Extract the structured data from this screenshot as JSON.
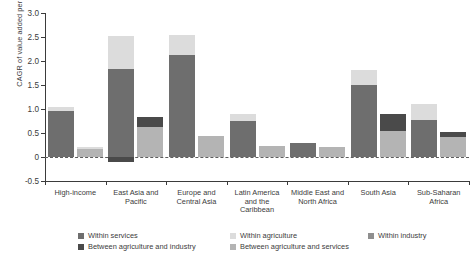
{
  "chart_data": {
    "type": "bar",
    "subtype": "grouped-stacked",
    "title": "",
    "xlabel": "",
    "ylabel": "CAGR of value added per worker (%)",
    "ylim": [
      -0.5,
      3.0
    ],
    "yticks": [
      "3.0",
      "2.5",
      "2.0",
      "1.5",
      "1.0",
      "0.5",
      "0",
      "-0.5"
    ],
    "ytick_values": [
      3.0,
      2.5,
      2.0,
      1.5,
      1.0,
      0.5,
      0.0,
      -0.5
    ],
    "grid": false,
    "zero_reference_line": true,
    "legend_position": "bottom",
    "categories": [
      "High-income",
      "East Asia and Pacific",
      "Europe and Central Asia",
      "Latin America and the Caribbean",
      "Middle East and North Africa",
      "South Asia",
      "Sub-Saharan Africa"
    ],
    "series": [
      {
        "name": "Within services",
        "color": "#6e6e6e",
        "values_bar1": [
          0.95,
          1.83,
          2.13,
          0.88,
          0.3,
          1.5,
          0.8
        ],
        "values_bar2": [
          0.1,
          0.62,
          0.42,
          0.2,
          0.19,
          0.55,
          0.35
        ]
      },
      {
        "name": "Within agriculture",
        "color": "#dcdcdc",
        "values_bar1": [
          0.09,
          0.7,
          0.41,
          0.13,
          0.0,
          0.31,
          0.31
        ],
        "values_bar2": [
          0.0,
          0.0,
          0.0,
          0.0,
          0.0,
          0.0,
          0.0
        ]
      },
      {
        "name": "Within industry",
        "color": "#8f8f8f",
        "values_bar1": [
          0.0,
          0.0,
          0.0,
          0.0,
          0.0,
          0.0,
          0.0
        ],
        "values_bar2": [
          0.0,
          0.62,
          0.0,
          0.0,
          0.0,
          0.55,
          0.0
        ]
      },
      {
        "name": "Between agriculture and industry",
        "color": "#4a4a4a",
        "values_bar1": [
          0.0,
          -0.11,
          0.0,
          0.0,
          0.0,
          0.0,
          0.0
        ],
        "values_bar2": [
          0.0,
          0.22,
          0.0,
          0.0,
          0.0,
          0.21,
          0.14
        ]
      },
      {
        "name": "Between agriculture and services",
        "color": "#b4b4b4",
        "values_bar1": [
          0.0,
          0.0,
          0.0,
          0.0,
          0.0,
          0.0,
          0.0
        ],
        "values_bar2": [
          0.2,
          0.0,
          0.42,
          0.2,
          0.19,
          0.0,
          0.35
        ]
      }
    ],
    "bars": [
      {
        "group": "High-income",
        "bar": 1,
        "segments": [
          {
            "name": "Within services",
            "value": 0.95,
            "color": "#6e6e6e"
          },
          {
            "name": "Within agriculture",
            "value": 0.09,
            "color": "#dcdcdc"
          }
        ],
        "total": 1.04
      },
      {
        "group": "High-income",
        "bar": 2,
        "segments": [
          {
            "name": "Between agriculture and services",
            "value": 0.16,
            "color": "#b4b4b4"
          },
          {
            "name": "Within agriculture",
            "value": 0.05,
            "color": "#dcdcdc"
          }
        ],
        "total": 0.21
      },
      {
        "group": "East Asia and Pacific",
        "bar": 1,
        "segments": [
          {
            "name": "Within services",
            "value": 1.83,
            "color": "#6e6e6e"
          },
          {
            "name": "Within agriculture",
            "value": 0.7,
            "color": "#dcdcdc"
          },
          {
            "name": "Between agriculture and industry",
            "value": -0.11,
            "color": "#4a4a4a"
          }
        ],
        "total": 2.53
      },
      {
        "group": "East Asia and Pacific",
        "bar": 2,
        "segments": [
          {
            "name": "Between agriculture and services",
            "value": 0.62,
            "color": "#b4b4b4"
          },
          {
            "name": "Between agriculture and industry",
            "value": 0.22,
            "color": "#4a4a4a"
          }
        ],
        "total": 0.84
      },
      {
        "group": "Europe and Central Asia",
        "bar": 1,
        "segments": [
          {
            "name": "Within services",
            "value": 2.13,
            "color": "#6e6e6e"
          },
          {
            "name": "Within agriculture",
            "value": 0.41,
            "color": "#dcdcdc"
          }
        ],
        "total": 2.54
      },
      {
        "group": "Europe and Central Asia",
        "bar": 2,
        "segments": [
          {
            "name": "Between agriculture and services",
            "value": 0.43,
            "color": "#b4b4b4"
          }
        ],
        "total": 0.43
      },
      {
        "group": "Latin America and the Caribbean",
        "bar": 1,
        "segments": [
          {
            "name": "Within services",
            "value": 0.75,
            "color": "#6e6e6e"
          },
          {
            "name": "Within agriculture",
            "value": 0.15,
            "color": "#dcdcdc"
          }
        ],
        "total": 0.9
      },
      {
        "group": "Latin America and the Caribbean",
        "bar": 2,
        "segments": [
          {
            "name": "Between agriculture and services",
            "value": 0.23,
            "color": "#b4b4b4"
          }
        ],
        "total": 0.23
      },
      {
        "group": "Middle East and North Africa",
        "bar": 1,
        "segments": [
          {
            "name": "Within services",
            "value": 0.3,
            "color": "#6e6e6e"
          }
        ],
        "total": 0.3
      },
      {
        "group": "Middle East and North Africa",
        "bar": 2,
        "segments": [
          {
            "name": "Between agriculture and services",
            "value": 0.21,
            "color": "#b4b4b4"
          }
        ],
        "total": 0.21
      },
      {
        "group": "South Asia",
        "bar": 1,
        "segments": [
          {
            "name": "Within services",
            "value": 1.5,
            "color": "#6e6e6e"
          },
          {
            "name": "Within agriculture",
            "value": 0.31,
            "color": "#dcdcdc"
          }
        ],
        "total": 1.81
      },
      {
        "group": "South Asia",
        "bar": 2,
        "segments": [
          {
            "name": "Between agriculture and services",
            "value": 0.55,
            "color": "#b4b4b4"
          },
          {
            "name": "Between agriculture and industry",
            "value": 0.35,
            "color": "#4a4a4a"
          }
        ],
        "total": 0.9
      },
      {
        "group": "Sub-Saharan Africa",
        "bar": 1,
        "segments": [
          {
            "name": "Within services",
            "value": 0.78,
            "color": "#6e6e6e"
          },
          {
            "name": "Within agriculture",
            "value": 0.33,
            "color": "#dcdcdc"
          }
        ],
        "total": 1.11
      },
      {
        "group": "Sub-Saharan Africa",
        "bar": 2,
        "segments": [
          {
            "name": "Between agriculture and services",
            "value": 0.42,
            "color": "#b4b4b4"
          },
          {
            "name": "Between agriculture and industry",
            "value": 0.1,
            "color": "#4a4a4a"
          }
        ],
        "total": 0.52
      }
    ]
  },
  "axis": {
    "ylabel": "CAGR of value added per worker (%)",
    "ticks": [
      "3.0",
      "2.5",
      "2.0",
      "1.5",
      "1.0",
      "0.5",
      "0",
      "-0.5"
    ]
  },
  "xaxis": {
    "labels": [
      [
        "High-income"
      ],
      [
        "East Asia and",
        "Pacific"
      ],
      [
        "Europe and",
        "Central Asia"
      ],
      [
        "Latin America",
        "and the",
        "Caribbean"
      ],
      [
        "Middle East and",
        "North Africa"
      ],
      [
        "South Asia"
      ],
      [
        "Sub-Saharan",
        "Africa"
      ]
    ]
  },
  "legend": {
    "items": [
      {
        "label": "Within services",
        "color": "#6e6e6e"
      },
      {
        "label": "Within agriculture",
        "color": "#dcdcdc"
      },
      {
        "label": "Within industry",
        "color": "#8f8f8f"
      },
      {
        "label": "Between agriculture and industry",
        "color": "#4a4a4a"
      },
      {
        "label": "Between agriculture and services",
        "color": "#b4b4b4"
      }
    ]
  }
}
